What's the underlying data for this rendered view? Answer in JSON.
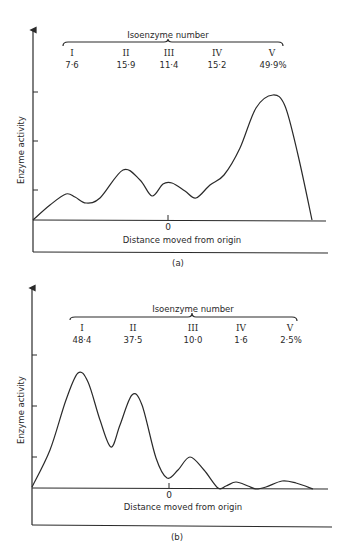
{
  "chart_data": [
    {
      "id": "a",
      "type": "line",
      "panel_label": "(a)",
      "title": "Isoenzyme number",
      "xlabel": "Distance moved from origin",
      "ylabel": "Enzyme activity",
      "origin_tick_label": "0",
      "isoenzymes": [
        {
          "name": "I",
          "percent": "7·6"
        },
        {
          "name": "II",
          "percent": "15·9"
        },
        {
          "name": "III",
          "percent": "11·4"
        },
        {
          "name": "IV",
          "percent": "15·2"
        },
        {
          "name": "V",
          "percent": "49·9%"
        }
      ],
      "y_ticks": 3,
      "grid": false,
      "curve_points_px": [
        [
          33,
          220
        ],
        [
          50,
          205
        ],
        [
          66,
          194
        ],
        [
          75,
          197
        ],
        [
          86,
          203
        ],
        [
          100,
          198
        ],
        [
          123,
          170
        ],
        [
          140,
          180
        ],
        [
          152,
          196
        ],
        [
          163,
          184
        ],
        [
          172,
          183
        ],
        [
          185,
          191
        ],
        [
          196,
          198
        ],
        [
          210,
          185
        ],
        [
          224,
          175
        ],
        [
          240,
          148
        ],
        [
          256,
          108
        ],
        [
          273,
          95
        ],
        [
          285,
          106
        ],
        [
          298,
          155
        ],
        [
          312,
          220
        ]
      ]
    },
    {
      "id": "b",
      "type": "line",
      "panel_label": "(b)",
      "title": "Isoenzyme number",
      "xlabel": "Distance moved from origin",
      "ylabel": "Enzyme activity",
      "origin_tick_label": "0",
      "isoenzymes": [
        {
          "name": "I",
          "percent": "48·4"
        },
        {
          "name": "II",
          "percent": "37·5"
        },
        {
          "name": "III",
          "percent": "10·0"
        },
        {
          "name": "IV",
          "percent": "1·6"
        },
        {
          "name": "V",
          "percent": "2·5%"
        }
      ],
      "y_ticks": 3,
      "grid": false,
      "curve_points_px": [
        [
          32,
          487
        ],
        [
          50,
          450
        ],
        [
          66,
          400
        ],
        [
          78,
          373
        ],
        [
          88,
          382
        ],
        [
          100,
          420
        ],
        [
          111,
          447
        ],
        [
          120,
          425
        ],
        [
          132,
          395
        ],
        [
          142,
          405
        ],
        [
          156,
          458
        ],
        [
          167,
          478
        ],
        [
          178,
          470
        ],
        [
          190,
          457
        ],
        [
          204,
          470
        ],
        [
          218,
          488
        ],
        [
          226,
          486
        ],
        [
          236,
          482
        ],
        [
          248,
          486
        ],
        [
          256,
          489
        ],
        [
          266,
          487
        ],
        [
          282,
          481
        ],
        [
          296,
          483
        ],
        [
          313,
          489
        ]
      ]
    }
  ]
}
